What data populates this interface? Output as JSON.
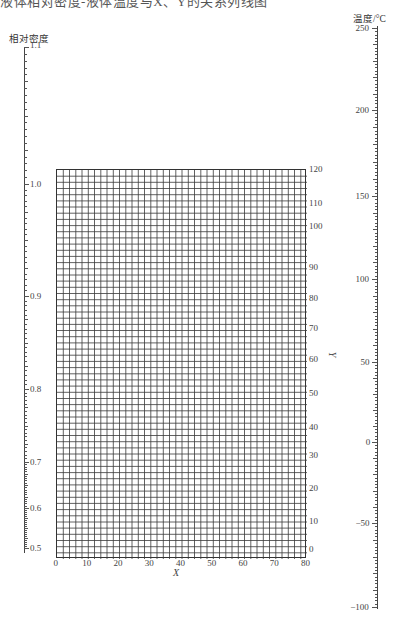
{
  "caption": {
    "text": "液体相对密度-液体温度与X、Y的关系列线图",
    "clipped": true
  },
  "chart_data": {
    "type": "nomograph",
    "left_axis": {
      "label": "相对密度",
      "ticks": [
        {
          "value": "1.1",
          "y": 47
        },
        {
          "value": "1.0",
          "y": 184
        },
        {
          "value": "0.9",
          "y": 296
        },
        {
          "value": "0.8",
          "y": 389
        },
        {
          "value": "0.7",
          "y": 462
        },
        {
          "value": "0.6",
          "y": 508
        },
        {
          "value": "0.5",
          "y": 548
        }
      ],
      "range": [
        0.5,
        1.1
      ],
      "scale": "nonlinear"
    },
    "grid": {
      "x_label": "X",
      "y_label": "Y",
      "x_ticks": [
        "0",
        "10",
        "20",
        "30",
        "40",
        "50",
        "60",
        "70",
        "80"
      ],
      "y_ticks": [
        {
          "value": "120",
          "y": 169
        },
        {
          "value": "110",
          "y": 203
        },
        {
          "value": "100",
          "y": 226
        },
        {
          "value": "90",
          "y": 267
        },
        {
          "value": "80",
          "y": 298
        },
        {
          "value": "70",
          "y": 328
        },
        {
          "value": "60",
          "y": 359
        },
        {
          "value": "50",
          "y": 393
        },
        {
          "value": "40",
          "y": 427
        },
        {
          "value": "30",
          "y": 455
        },
        {
          "value": "20",
          "y": 488
        },
        {
          "value": "10",
          "y": 521
        },
        {
          "value": "0",
          "y": 549
        }
      ],
      "xlim": [
        0,
        80
      ],
      "ylim": [
        0,
        120
      ],
      "columns": 40,
      "rows": 63,
      "grid_on": true
    },
    "right_axis": {
      "label": "温度/°C",
      "ticks": [
        {
          "value": "250",
          "y": 28
        },
        {
          "value": "200",
          "y": 110
        },
        {
          "value": "150",
          "y": 196
        },
        {
          "value": "100",
          "y": 279
        },
        {
          "value": "50",
          "y": 362
        },
        {
          "value": "0",
          "y": 442
        },
        {
          "value": "−50",
          "y": 523
        },
        {
          "value": "−100",
          "y": 607
        }
      ],
      "range": [
        -100,
        250
      ],
      "scale": "linear"
    }
  }
}
